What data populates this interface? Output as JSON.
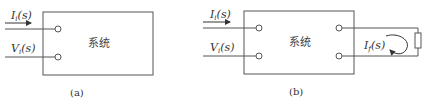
{
  "diagrams": [
    {
      "id": "a",
      "caption": "(a)",
      "box_label": "系统",
      "inputs": [
        {
          "symbol": "I",
          "subscript": "i",
          "arg": "(s)",
          "kind": "current"
        },
        {
          "symbol": "V",
          "subscript": "i",
          "arg": "(s)",
          "kind": "voltage"
        }
      ]
    },
    {
      "id": "b",
      "caption": "(b)",
      "box_label": "系统",
      "inputs": [
        {
          "symbol": "I",
          "subscript": "i",
          "arg": "(s)",
          "kind": "current"
        },
        {
          "symbol": "V",
          "subscript": "i",
          "arg": "(s)",
          "kind": "voltage"
        }
      ],
      "output_loop": {
        "symbol": "I",
        "subscript": "f",
        "arg": "(s)",
        "load": "resistor"
      }
    }
  ],
  "colors": {
    "line": "#555555",
    "text": "#333333",
    "background": "#ffffff"
  }
}
